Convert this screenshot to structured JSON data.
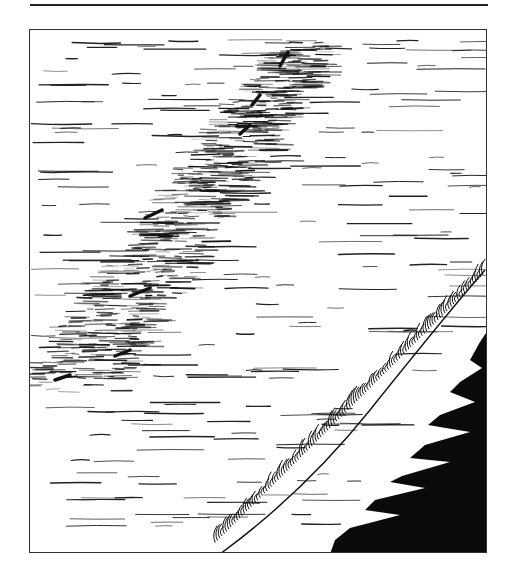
{
  "illustration": {
    "subject": "ink drawing of sunlit water with waves breaking on a dark shore",
    "colors": {
      "ink": "#111111",
      "paper": "#ffffff",
      "frame": "#333333"
    }
  }
}
